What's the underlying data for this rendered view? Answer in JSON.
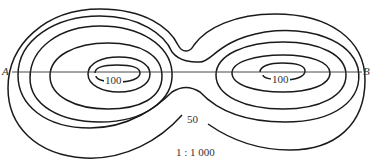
{
  "diagram": {
    "type": "topographic-contour-map",
    "points": {
      "a": "A",
      "b": "B"
    },
    "contour_labels": {
      "left_peak": "100",
      "right_peak": "100",
      "outer": "50"
    },
    "scale": "1 : 1 000",
    "colors": {
      "line": "#1a1a1a",
      "text": "#333333",
      "background": "#ffffff"
    }
  }
}
